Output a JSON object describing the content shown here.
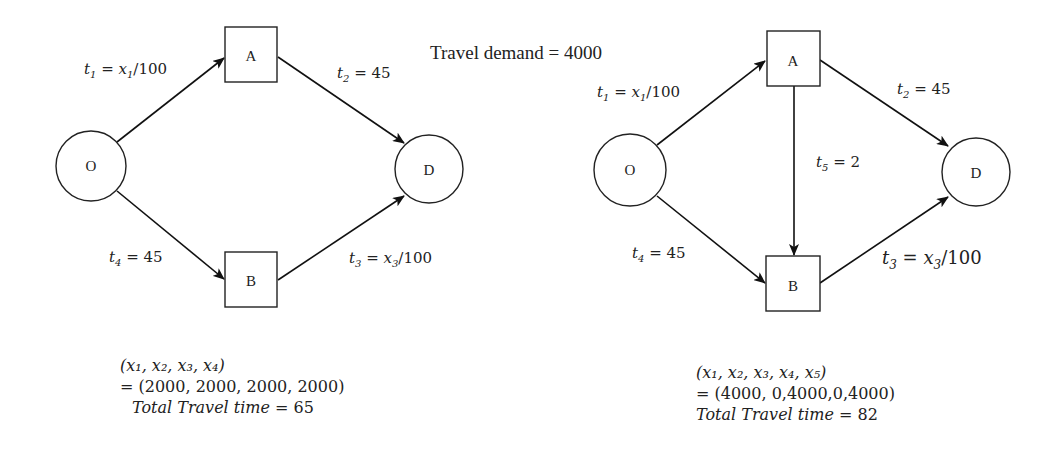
{
  "title": "Travel demand = 4000",
  "left_network": {
    "nodes": {
      "origin": "O",
      "a": "A",
      "b": "B",
      "destination": "D"
    },
    "edges": {
      "t1": {
        "var": "t",
        "sub": "1",
        "rhs": " = x",
        "rhs_sub": "1",
        "tail": "/100"
      },
      "t2": {
        "var": "t",
        "sub": "2",
        "rhs": " = 45"
      },
      "t3": {
        "var": "t",
        "sub": "3",
        "rhs": " = x",
        "rhs_sub": "3",
        "tail": "/100"
      },
      "t4": {
        "var": "t",
        "sub": "4",
        "rhs": " = 45"
      }
    },
    "result": {
      "flow_vars": "(x₁, x₂, x₃, x₄)",
      "flow_values": "= (2000, 2000, 2000, 2000)",
      "total_label": "Total Travel time",
      "total_eq": " =  65"
    }
  },
  "right_network": {
    "nodes": {
      "origin": "O",
      "a": "A",
      "b": "B",
      "destination": "D"
    },
    "edges": {
      "t1": {
        "var": "t",
        "sub": "1",
        "rhs": " = x",
        "rhs_sub": "1",
        "tail": "/100"
      },
      "t2": {
        "var": "t",
        "sub": "2",
        "rhs": " = 45"
      },
      "t3": {
        "var": "t",
        "sub": "3",
        "rhs": " = x",
        "rhs_sub": "3",
        "tail": "/100"
      },
      "t4": {
        "var": "t",
        "sub": "4",
        "rhs": " = 45"
      },
      "t5": {
        "var": "t",
        "sub": "5",
        "rhs": " = 2"
      }
    },
    "result": {
      "flow_vars": "(x₁, x₂, x₃, x₄, x₅)",
      "flow_values": "= (4000, 0,4000,0,4000)",
      "total_label": "Total Travel time",
      "total_eq": " =  82"
    }
  }
}
